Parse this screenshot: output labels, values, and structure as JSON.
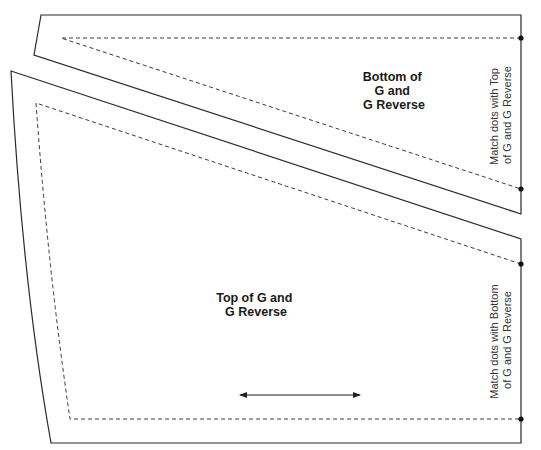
{
  "pieces": [
    {
      "id": "bottom-piece",
      "label_lines": [
        "Bottom of",
        "G and",
        "G Reverse"
      ],
      "note_lines": [
        "Match dots with Top",
        "of G and G Reverse"
      ]
    },
    {
      "id": "top-piece",
      "label_lines": [
        "Top of G and",
        "G Reverse"
      ],
      "note_lines": [
        "Match dots with Bottom",
        "of G and G Reverse"
      ]
    }
  ],
  "grainline": {
    "icon": "double-headed-arrow",
    "direction": "horizontal"
  },
  "colors": {
    "line": "#2a2a2a",
    "background": "#ffffff"
  }
}
